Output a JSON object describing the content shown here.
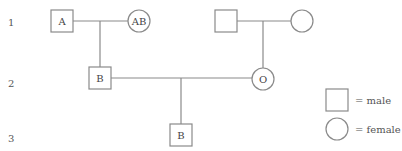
{
  "diagram": {
    "type": "pedigree",
    "generations": [
      {
        "label": "1",
        "y": 22
      },
      {
        "label": "2",
        "y": 83
      },
      {
        "label": "3",
        "y": 138
      }
    ],
    "individuals": [
      {
        "id": "g1-male-left",
        "sex": "male",
        "label": "A"
      },
      {
        "id": "g1-female-left",
        "sex": "female",
        "label": "AB"
      },
      {
        "id": "g1-male-right",
        "sex": "male",
        "label": ""
      },
      {
        "id": "g1-female-right",
        "sex": "female",
        "label": ""
      },
      {
        "id": "g2-male",
        "sex": "male",
        "label": "B"
      },
      {
        "id": "g2-female",
        "sex": "female",
        "label": "O"
      },
      {
        "id": "g3-male",
        "sex": "male",
        "label": "B"
      }
    ],
    "legend": {
      "male_label": "= male",
      "female_label": "= female"
    }
  },
  "colors": {
    "stroke": "#8a8a8a",
    "text": "#444444",
    "background": "#ffffff"
  }
}
